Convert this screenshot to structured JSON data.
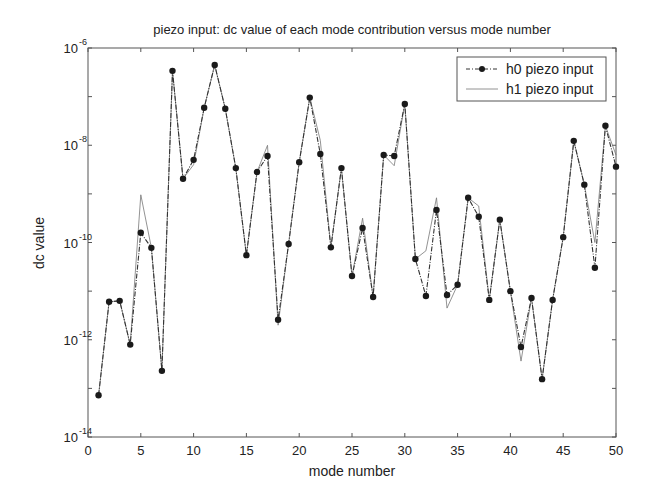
{
  "chart_data": {
    "type": "line",
    "title": "piezo input:  dc value of each mode contribution versus mode number",
    "xlabel": "mode number",
    "ylabel": "dc value",
    "yscale": "log",
    "xlim": [
      0,
      50
    ],
    "ylim": [
      1e-14,
      1e-06
    ],
    "xticks": [
      0,
      5,
      10,
      15,
      20,
      25,
      30,
      35,
      40,
      45,
      50
    ],
    "yticks": [
      {
        "base": "10",
        "exp": "-14",
        "value": 1e-14
      },
      {
        "base": "10",
        "exp": "-12",
        "value": 1e-12
      },
      {
        "base": "10",
        "exp": "-10",
        "value": 1e-10
      },
      {
        "base": "10",
        "exp": "-8",
        "value": 1e-08
      },
      {
        "base": "10",
        "exp": "-6",
        "value": 1e-06
      }
    ],
    "grid": false,
    "legend_position": "upper right",
    "x": [
      1,
      2,
      3,
      4,
      5,
      6,
      7,
      8,
      9,
      10,
      11,
      12,
      13,
      14,
      15,
      16,
      17,
      18,
      19,
      20,
      21,
      22,
      23,
      24,
      25,
      26,
      27,
      28,
      29,
      30,
      31,
      32,
      33,
      34,
      35,
      36,
      37,
      38,
      39,
      40,
      41,
      42,
      43,
      44,
      45,
      46,
      47,
      48,
      49,
      50
    ],
    "series": [
      {
        "name": "h0 piezo input",
        "style": "dash-dot with filled circle markers",
        "log10_values": [
          -13.14,
          -11.22,
          -11.2,
          -12.1,
          -9.8,
          -10.11,
          -12.64,
          -6.47,
          -8.69,
          -8.3,
          -7.23,
          -6.35,
          -7.25,
          -8.47,
          -10.26,
          -8.55,
          -8.22,
          -11.59,
          -10.03,
          -8.35,
          -7.02,
          -8.18,
          -10.1,
          -8.47,
          -10.69,
          -9.7,
          -11.12,
          -8.2,
          -8.22,
          -7.15,
          -10.34,
          -11.1,
          -9.33,
          -11.08,
          -10.87,
          -9.08,
          -9.47,
          -11.18,
          -9.53,
          -11.0,
          -12.15,
          -11.14,
          -12.81,
          -11.18,
          -9.89,
          -7.91,
          -8.81,
          -10.52,
          -7.6,
          -8.44
        ]
      },
      {
        "name": "h1 piezo input",
        "style": "thin solid line",
        "log10_values": [
          -13.14,
          -11.22,
          -11.2,
          -12.1,
          -9.02,
          -10.11,
          -12.64,
          -6.47,
          -8.69,
          -8.4,
          -7.23,
          -6.35,
          -7.25,
          -8.47,
          -10.26,
          -8.55,
          -8.0,
          -11.7,
          -10.03,
          -8.35,
          -7.02,
          -7.9,
          -10.1,
          -8.47,
          -10.69,
          -9.5,
          -11.12,
          -8.2,
          -8.42,
          -7.15,
          -10.34,
          -10.17,
          -9.08,
          -11.35,
          -10.87,
          -9.08,
          -9.25,
          -11.18,
          -9.53,
          -11.0,
          -12.44,
          -11.14,
          -12.81,
          -11.18,
          -9.89,
          -7.91,
          -8.81,
          -10.0,
          -7.6,
          -8.2
        ]
      }
    ]
  },
  "legend": {
    "items": [
      {
        "label": "h0 piezo input"
      },
      {
        "label": "h1 piezo input"
      }
    ]
  },
  "colors": {
    "line": "#333333",
    "marker": "#1a1a1a",
    "axes": "#444444",
    "background": "#ffffff"
  }
}
